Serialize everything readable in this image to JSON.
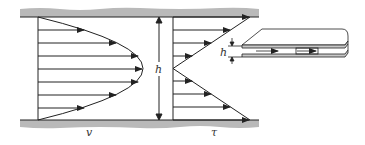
{
  "diagram": {
    "labels": {
      "velocity": "v",
      "shear": "τ",
      "height": "h",
      "inset_height": "h"
    },
    "colors": {
      "wall": "#b9b9b9",
      "line": "#222222",
      "plate": "#c8c8c8"
    },
    "velocity_profile": {
      "shape": "parabolic",
      "arrows": 7
    },
    "shear_profile": {
      "shape": "linear, zero at centerline",
      "arrows": 8
    },
    "inset": {
      "description": "two parallel plates with flow arrows between them"
    }
  }
}
